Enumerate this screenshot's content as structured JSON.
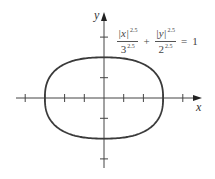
{
  "figure": {
    "equation": {
      "term1": {
        "numerator_var": "|x|",
        "denominator_base": "3",
        "exponent": "2.5"
      },
      "plus": "+",
      "term2": {
        "numerator_var": "|y|",
        "denominator_base": "2",
        "exponent": "2.5"
      },
      "equals": "=",
      "rhs": "1"
    },
    "axes": {
      "x_label": "x",
      "y_label": "y",
      "x_ticks": [
        -4,
        -3,
        -2,
        -1,
        1,
        2,
        3,
        4
      ],
      "y_ticks": [
        -3,
        -2,
        -1,
        1,
        2,
        3
      ]
    },
    "curve": {
      "type": "superellipse",
      "a": 3,
      "b": 2,
      "n": 2.5
    },
    "colors": {
      "line": "#444444",
      "curve": "#3a3a3a",
      "text": "#444444"
    }
  }
}
